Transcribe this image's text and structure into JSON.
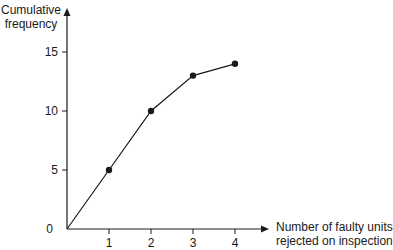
{
  "chart_data": {
    "type": "line",
    "title": "",
    "xlabel": "Number of faulty units rejected on inspection",
    "ylabel": "Cumulative frequency",
    "xlabel_lines": [
      "Number of faulty units",
      "rejected on inspection"
    ],
    "ylabel_lines": [
      "Cumulative",
      "frequency"
    ],
    "x": [
      0,
      1,
      2,
      3,
      4
    ],
    "values": [
      0,
      5,
      10,
      13,
      14
    ],
    "x_ticks": [
      "1",
      "2",
      "3",
      "4"
    ],
    "y_ticks": [
      "0",
      "5",
      "10",
      "15"
    ],
    "xlim": [
      0,
      4
    ],
    "ylim": [
      0,
      15
    ],
    "grid": false,
    "legend": null,
    "markers": "filled-circle",
    "line_color": "#1a1a1a"
  }
}
